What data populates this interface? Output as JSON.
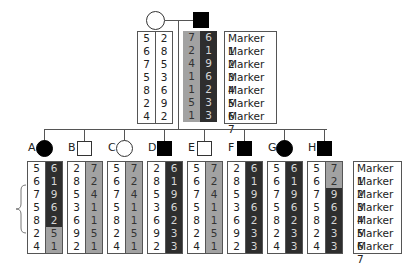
{
  "markers": [
    "Marker 1",
    "Marker 2",
    "Marker 3",
    "Marker 4",
    "Marker 5",
    "Marker 6",
    "Marker 7"
  ],
  "colors": {
    "dark": "#2e2e2e",
    "grey": "#a2a2a2",
    "white": "#ffffff"
  },
  "parents": {
    "mother": {
      "affected": false,
      "shape": "circle",
      "col1": {
        "shade": "w",
        "values": [
          "5",
          "6",
          "7",
          "5",
          "8",
          "2",
          "4"
        ]
      },
      "col2": {
        "shade": "w",
        "values": [
          "2",
          "8",
          "5",
          "3",
          "6",
          "9",
          "2"
        ]
      }
    },
    "father": {
      "affected": true,
      "shape": "square",
      "col1": {
        "shade": "g",
        "values": [
          "7",
          "2",
          "4",
          "1",
          "1",
          "5",
          "1"
        ]
      },
      "col2": {
        "shade": "d",
        "values": [
          "6",
          "1",
          "9",
          "6",
          "2",
          "3",
          "3"
        ]
      }
    }
  },
  "offspring": [
    {
      "label": "A",
      "shape": "circle",
      "affected": true,
      "col1": [
        "5",
        "6",
        "7",
        "5",
        "8",
        "2",
        "4"
      ],
      "col1_shade": [
        "w",
        "w",
        "w",
        "w",
        "w",
        "w",
        "w"
      ],
      "col2": [
        "6",
        "1",
        "9",
        "6",
        "2",
        "5",
        "1"
      ],
      "col2_shade": [
        "d",
        "d",
        "d",
        "d",
        "d",
        "g",
        "g"
      ]
    },
    {
      "label": "B",
      "shape": "square",
      "affected": false,
      "col1": [
        "2",
        "8",
        "5",
        "3",
        "6",
        "9",
        "2"
      ],
      "col1_shade": [
        "w",
        "w",
        "w",
        "w",
        "w",
        "w",
        "w"
      ],
      "col2": [
        "7",
        "2",
        "4",
        "1",
        "1",
        "5",
        "1"
      ],
      "col2_shade": [
        "g",
        "g",
        "g",
        "g",
        "g",
        "g",
        "g"
      ]
    },
    {
      "label": "C",
      "shape": "circle",
      "affected": false,
      "col1": [
        "5",
        "6",
        "7",
        "5",
        "8",
        "2",
        "4"
      ],
      "col1_shade": [
        "w",
        "w",
        "w",
        "w",
        "w",
        "w",
        "w"
      ],
      "col2": [
        "7",
        "2",
        "4",
        "1",
        "1",
        "5",
        "1"
      ],
      "col2_shade": [
        "g",
        "g",
        "g",
        "g",
        "g",
        "g",
        "g"
      ]
    },
    {
      "label": "D",
      "shape": "square",
      "affected": true,
      "col1": [
        "2",
        "8",
        "5",
        "3",
        "6",
        "9",
        "2"
      ],
      "col1_shade": [
        "w",
        "w",
        "w",
        "w",
        "w",
        "w",
        "w"
      ],
      "col2": [
        "6",
        "1",
        "9",
        "6",
        "2",
        "3",
        "3"
      ],
      "col2_shade": [
        "d",
        "d",
        "d",
        "d",
        "d",
        "d",
        "d"
      ]
    },
    {
      "label": "E",
      "shape": "square",
      "affected": false,
      "col1": [
        "5",
        "6",
        "7",
        "5",
        "8",
        "2",
        "4"
      ],
      "col1_shade": [
        "w",
        "w",
        "w",
        "w",
        "w",
        "w",
        "w"
      ],
      "col2": [
        "7",
        "2",
        "4",
        "1",
        "1",
        "5",
        "1"
      ],
      "col2_shade": [
        "g",
        "g",
        "g",
        "g",
        "g",
        "g",
        "g"
      ]
    },
    {
      "label": "F",
      "shape": "square",
      "affected": true,
      "col1": [
        "2",
        "8",
        "5",
        "3",
        "6",
        "9",
        "2"
      ],
      "col1_shade": [
        "w",
        "w",
        "w",
        "w",
        "w",
        "w",
        "w"
      ],
      "col2": [
        "6",
        "1",
        "9",
        "6",
        "2",
        "3",
        "3"
      ],
      "col2_shade": [
        "d",
        "d",
        "d",
        "d",
        "d",
        "d",
        "d"
      ]
    },
    {
      "label": "G",
      "shape": "circle",
      "affected": true,
      "col1": [
        "5",
        "6",
        "7",
        "5",
        "8",
        "2",
        "4"
      ],
      "col1_shade": [
        "w",
        "w",
        "w",
        "w",
        "w",
        "w",
        "w"
      ],
      "col2": [
        "6",
        "1",
        "9",
        "6",
        "2",
        "3",
        "3"
      ],
      "col2_shade": [
        "d",
        "d",
        "d",
        "d",
        "d",
        "d",
        "d"
      ]
    },
    {
      "label": "H",
      "shape": "square",
      "affected": true,
      "col1": [
        "5",
        "6",
        "7",
        "5",
        "8",
        "2",
        "4"
      ],
      "col1_shade": [
        "w",
        "w",
        "w",
        "w",
        "w",
        "w",
        "w"
      ],
      "col2": [
        "7",
        "2",
        "9",
        "6",
        "2",
        "3",
        "3"
      ],
      "col2_shade": [
        "g",
        "g",
        "d",
        "d",
        "d",
        "d",
        "d"
      ]
    }
  ],
  "annotation": {
    "brace_markers": [
      "Marker 3",
      "Marker 4",
      "Marker 5"
    ]
  }
}
